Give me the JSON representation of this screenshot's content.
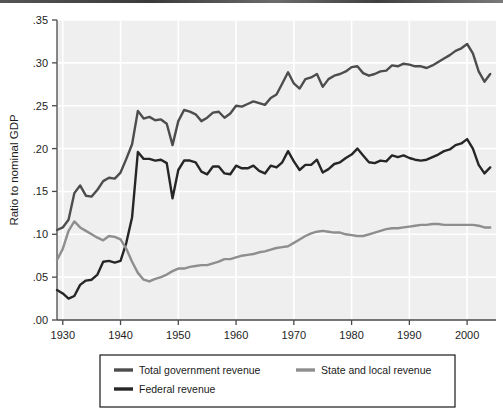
{
  "figure": {
    "ylabel": "Ratio to nominal GDP",
    "background": "#efefef",
    "gridline_color": "#ffffff",
    "axis_color": "#4a4a4a"
  },
  "legend": {
    "items": [
      {
        "label": "Total government revenue",
        "color": "#4d4d4d"
      },
      {
        "label": "State and local revenue",
        "color": "#8e8e8e"
      },
      {
        "label": "Federal revenue",
        "color": "#262626"
      }
    ]
  },
  "chart_data": {
    "type": "line",
    "title": "",
    "xlabel": "",
    "ylabel": "Ratio to nominal GDP",
    "xlim": [
      1929,
      2005
    ],
    "ylim": [
      0.0,
      0.35
    ],
    "grid": true,
    "legend_position": "bottom",
    "xticks": [
      1930,
      1940,
      1950,
      1960,
      1970,
      1980,
      1990,
      2000
    ],
    "xtick_labels": [
      "1930",
      "1940",
      "1950",
      "1960",
      "1970",
      "1980",
      "1990",
      "2000"
    ],
    "yticks": [
      0.0,
      0.05,
      0.1,
      0.15,
      0.2,
      0.25,
      0.3,
      0.35
    ],
    "ytick_labels": [
      ".00",
      ".05",
      ".10",
      ".15",
      ".20",
      ".25",
      ".30",
      ".35"
    ],
    "x": [
      1929,
      1930,
      1931,
      1932,
      1933,
      1934,
      1935,
      1936,
      1937,
      1938,
      1939,
      1940,
      1941,
      1942,
      1943,
      1944,
      1945,
      1946,
      1947,
      1948,
      1949,
      1950,
      1951,
      1952,
      1953,
      1954,
      1955,
      1956,
      1957,
      1958,
      1959,
      1960,
      1961,
      1962,
      1963,
      1964,
      1965,
      1966,
      1967,
      1968,
      1969,
      1970,
      1971,
      1972,
      1973,
      1974,
      1975,
      1976,
      1977,
      1978,
      1979,
      1980,
      1981,
      1982,
      1983,
      1984,
      1985,
      1986,
      1987,
      1988,
      1989,
      1990,
      1991,
      1992,
      1993,
      1994,
      1995,
      1996,
      1997,
      1998,
      1999,
      2000,
      2001,
      2002,
      2003,
      2004
    ],
    "series": [
      {
        "name": "Total government revenue",
        "color": "#4d4d4d",
        "values": [
          0.105,
          0.108,
          0.117,
          0.148,
          0.157,
          0.145,
          0.144,
          0.152,
          0.162,
          0.166,
          0.165,
          0.172,
          0.188,
          0.205,
          0.244,
          0.235,
          0.237,
          0.233,
          0.234,
          0.229,
          0.204,
          0.232,
          0.245,
          0.243,
          0.24,
          0.232,
          0.236,
          0.242,
          0.243,
          0.236,
          0.241,
          0.25,
          0.249,
          0.252,
          0.255,
          0.253,
          0.251,
          0.259,
          0.263,
          0.276,
          0.289,
          0.276,
          0.27,
          0.281,
          0.283,
          0.287,
          0.272,
          0.281,
          0.285,
          0.287,
          0.29,
          0.295,
          0.296,
          0.288,
          0.285,
          0.287,
          0.29,
          0.291,
          0.297,
          0.296,
          0.299,
          0.298,
          0.296,
          0.296,
          0.294,
          0.297,
          0.301,
          0.305,
          0.309,
          0.314,
          0.317,
          0.322,
          0.311,
          0.29,
          0.278,
          0.287
        ]
      },
      {
        "name": "Federal revenue",
        "color": "#262626",
        "values": [
          0.035,
          0.031,
          0.025,
          0.028,
          0.041,
          0.046,
          0.047,
          0.053,
          0.068,
          0.069,
          0.067,
          0.069,
          0.09,
          0.12,
          0.196,
          0.188,
          0.188,
          0.186,
          0.187,
          0.183,
          0.142,
          0.175,
          0.186,
          0.186,
          0.184,
          0.173,
          0.17,
          0.179,
          0.179,
          0.171,
          0.17,
          0.18,
          0.177,
          0.177,
          0.18,
          0.174,
          0.171,
          0.18,
          0.178,
          0.184,
          0.197,
          0.185,
          0.175,
          0.181,
          0.181,
          0.187,
          0.172,
          0.176,
          0.182,
          0.184,
          0.189,
          0.193,
          0.2,
          0.192,
          0.184,
          0.183,
          0.186,
          0.185,
          0.192,
          0.19,
          0.192,
          0.189,
          0.187,
          0.186,
          0.187,
          0.19,
          0.193,
          0.197,
          0.199,
          0.204,
          0.206,
          0.211,
          0.2,
          0.181,
          0.171,
          0.178
        ]
      },
      {
        "name": "State and local revenue",
        "color": "#8e8e8e",
        "values": [
          0.07,
          0.083,
          0.104,
          0.115,
          0.108,
          0.104,
          0.1,
          0.096,
          0.093,
          0.098,
          0.097,
          0.094,
          0.083,
          0.068,
          0.055,
          0.047,
          0.045,
          0.048,
          0.05,
          0.053,
          0.057,
          0.06,
          0.06,
          0.062,
          0.063,
          0.064,
          0.064,
          0.066,
          0.068,
          0.071,
          0.071,
          0.073,
          0.075,
          0.076,
          0.077,
          0.079,
          0.08,
          0.082,
          0.084,
          0.085,
          0.086,
          0.09,
          0.094,
          0.098,
          0.101,
          0.103,
          0.104,
          0.103,
          0.102,
          0.102,
          0.1,
          0.099,
          0.098,
          0.098,
          0.1,
          0.102,
          0.104,
          0.106,
          0.107,
          0.107,
          0.108,
          0.109,
          0.11,
          0.111,
          0.111,
          0.112,
          0.112,
          0.111,
          0.111,
          0.111,
          0.111,
          0.111,
          0.111,
          0.11,
          0.108,
          0.108
        ]
      }
    ]
  }
}
